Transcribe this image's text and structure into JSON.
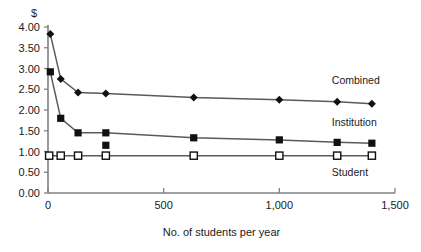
{
  "chart_data": {
    "type": "line",
    "title": "",
    "xlabel": "No. of students per year",
    "ylabel": "$",
    "xlim": [
      0,
      1500
    ],
    "ylim": [
      0,
      4.0
    ],
    "xticks": [
      0,
      500,
      1000,
      1500
    ],
    "xticklabels": [
      "0",
      "500",
      "1,000",
      "1,500"
    ],
    "yticks": [
      0.0,
      0.5,
      1.0,
      1.5,
      2.0,
      2.5,
      3.0,
      3.5,
      4.0
    ],
    "yticklabels": [
      "0.00",
      "0.50",
      "1.00",
      "1.50",
      "2.00",
      "2.50",
      "3.00",
      "3.50",
      "4.00"
    ],
    "grid": false,
    "legend_position": "right-inline",
    "series": [
      {
        "name": "Combined",
        "marker": "filled-diamond",
        "label_x": 1400,
        "label_y": 2.62,
        "points": [
          {
            "x": 10,
            "y": 3.83
          },
          {
            "x": 55,
            "y": 2.75
          },
          {
            "x": 130,
            "y": 2.42
          },
          {
            "x": 250,
            "y": 2.4
          },
          {
            "x": 630,
            "y": 2.3
          },
          {
            "x": 1000,
            "y": 2.25
          },
          {
            "x": 1250,
            "y": 2.2
          },
          {
            "x": 1400,
            "y": 2.15
          }
        ]
      },
      {
        "name": "Institution",
        "marker": "filled-square",
        "label_x": 1400,
        "label_y": 1.62,
        "points": [
          {
            "x": 10,
            "y": 2.92
          },
          {
            "x": 55,
            "y": 1.8
          },
          {
            "x": 130,
            "y": 1.45
          },
          {
            "x": 250,
            "y": 1.45
          },
          {
            "x": 630,
            "y": 1.33
          },
          {
            "x": 1000,
            "y": 1.28
          },
          {
            "x": 1250,
            "y": 1.22
          },
          {
            "x": 1400,
            "y": 1.2
          }
        ],
        "extra_points": [
          {
            "x": 250,
            "y": 1.15
          }
        ]
      },
      {
        "name": "Student",
        "marker": "open-square",
        "label_x": 1400,
        "label_y": 0.42,
        "points": [
          {
            "x": 5,
            "y": 0.9
          },
          {
            "x": 55,
            "y": 0.9
          },
          {
            "x": 130,
            "y": 0.9
          },
          {
            "x": 250,
            "y": 0.9
          },
          {
            "x": 630,
            "y": 0.9
          },
          {
            "x": 1000,
            "y": 0.9
          },
          {
            "x": 1250,
            "y": 0.9
          },
          {
            "x": 1400,
            "y": 0.9
          }
        ]
      }
    ],
    "colors": {
      "axis": "#808080",
      "line": "#5a5a5a",
      "marker": "#111111",
      "text": "#1a1a1a",
      "background": "#ffffff"
    }
  }
}
